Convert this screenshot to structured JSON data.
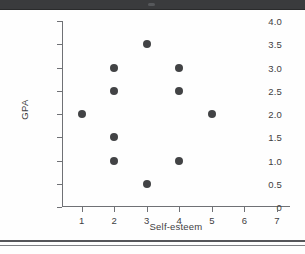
{
  "page": {
    "background_color": "#fefefe",
    "top_bar_color": "#3a3b3d",
    "rule_color": "#55565a"
  },
  "chart_data": {
    "type": "scatter",
    "title": "",
    "xlabel": "Self-esteem",
    "ylabel": "GPA",
    "xlim": [
      0.4,
      7.4
    ],
    "ylim": [
      0,
      4.0
    ],
    "grid": false,
    "legend": null,
    "marker_color": "#424345",
    "axis_color": "#6f7175",
    "xticks": [
      1,
      2,
      3,
      4,
      5,
      6,
      7
    ],
    "xtick_labels": [
      "1",
      "2",
      "3",
      "4",
      "5",
      "6",
      "7"
    ],
    "yticks": [
      0,
      0.5,
      1.0,
      1.5,
      2.0,
      2.5,
      3.0,
      3.5,
      4.0
    ],
    "ytick_labels": [
      "0",
      "0.5",
      "1.0",
      "1.5",
      "2.0",
      "2.5",
      "3.0",
      "3.5",
      "4.0"
    ],
    "points": [
      {
        "x": 1,
        "y": 2.0
      },
      {
        "x": 2,
        "y": 3.0
      },
      {
        "x": 2,
        "y": 2.5
      },
      {
        "x": 2,
        "y": 1.5
      },
      {
        "x": 2,
        "y": 1.0
      },
      {
        "x": 3,
        "y": 3.5
      },
      {
        "x": 3,
        "y": 0.5
      },
      {
        "x": 4,
        "y": 3.0
      },
      {
        "x": 4,
        "y": 2.5
      },
      {
        "x": 4,
        "y": 1.0
      },
      {
        "x": 5,
        "y": 2.0
      }
    ]
  }
}
